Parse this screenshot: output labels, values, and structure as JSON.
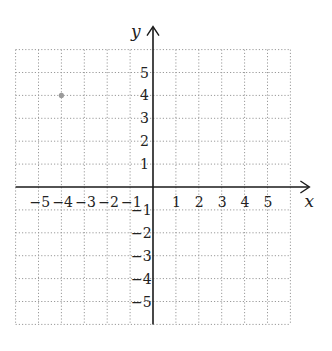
{
  "chart_data": {
    "type": "scatter",
    "title": "",
    "xlabel": "x",
    "ylabel": "y",
    "xlim": [
      -6,
      6
    ],
    "ylim": [
      -6,
      6
    ],
    "grid": true,
    "grid_style": "dotted",
    "x_ticks": [
      "-5",
      "-4",
      "-3",
      "-2",
      "-1",
      "1",
      "2",
      "3",
      "4",
      "5"
    ],
    "y_ticks": [
      "5",
      "4",
      "3",
      "2",
      "1",
      "-1",
      "-2",
      "-3",
      "-4",
      "-5"
    ],
    "points": [
      {
        "x": -4,
        "y": 4
      }
    ]
  },
  "colors": {
    "grid": "#9a9a9a",
    "axis": "#1a1a1a",
    "point": "#9a9a9a"
  }
}
